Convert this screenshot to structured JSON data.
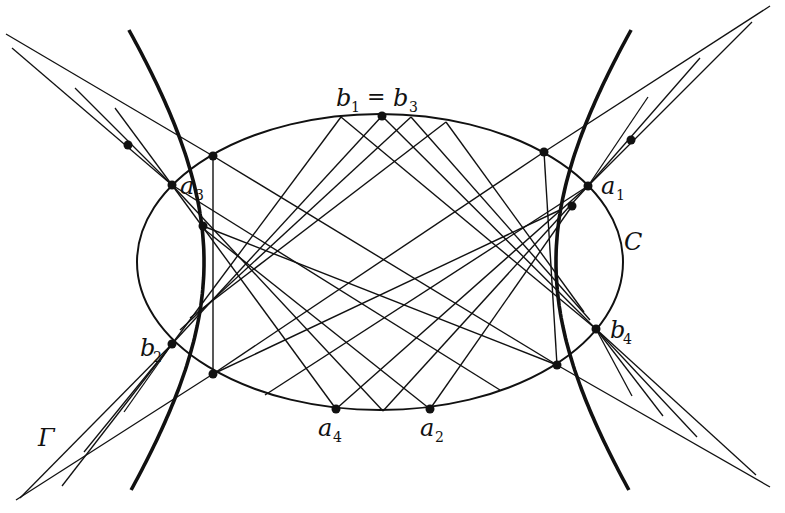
{
  "figure": {
    "ink_color": "#111111",
    "background": "#ffffff"
  },
  "labels": {
    "ellipse": "C",
    "hyperbola": "Γ",
    "top_point": {
      "a": "b",
      "a_sub": "1",
      "eq": "=",
      "b": "b",
      "b_sub": "3"
    },
    "a1": {
      "base": "a",
      "sub": "1"
    },
    "a2": {
      "base": "a",
      "sub": "2"
    },
    "a3": {
      "base": "a",
      "sub": "3"
    },
    "a4": {
      "base": "a",
      "sub": "4"
    },
    "b2": {
      "base": "b",
      "sub": "2"
    },
    "b4": {
      "base": "b",
      "sub": "4"
    }
  },
  "curves": {
    "ellipse": {
      "name": "C",
      "semi_major": 1.0,
      "semi_minor": 0.61
    },
    "hyperbola": {
      "name": "Γ",
      "vertex_ratio": 0.72
    }
  },
  "marked_points": [
    "b1=b3",
    "a1",
    "a2",
    "a3",
    "a4",
    "b2",
    "b4"
  ],
  "construction_points_count": 4
}
